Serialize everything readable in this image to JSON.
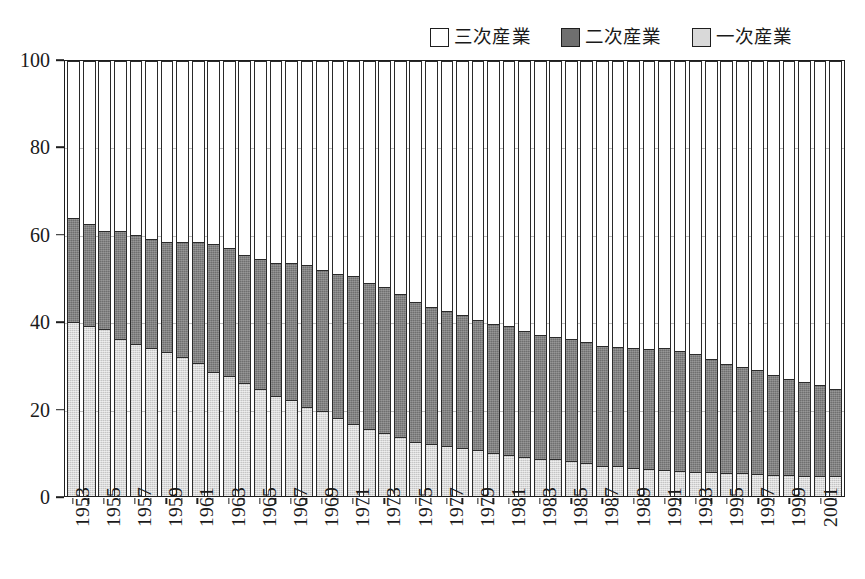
{
  "chart_data": {
    "type": "bar",
    "subtype": "stacked-100-percent-column",
    "title": "",
    "subtitle": "",
    "xlabel": "",
    "ylabel": "",
    "ylim": [
      0,
      100
    ],
    "yticks": [
      0,
      20,
      40,
      60,
      80,
      100
    ],
    "ytick_labels": [
      "0",
      "20",
      "40",
      "60",
      "80",
      "100"
    ],
    "grid": true,
    "grid_axis": "y",
    "legend_position": "top-right",
    "stack_order_bottom_to_top": [
      "primary",
      "secondary",
      "tertiary"
    ],
    "legend": [
      {
        "key": "tertiary",
        "label": "三次産業",
        "color": "#ffffff",
        "border": "#1e1e1e"
      },
      {
        "key": "secondary",
        "label": "二次産業",
        "color": "#6f6f6f",
        "border": "#1e1e1e"
      },
      {
        "key": "primary",
        "label": "一次産業",
        "color": "#d9d9d9",
        "border": "#1e1e1e"
      }
    ],
    "categories": [
      1953,
      1954,
      1955,
      1956,
      1957,
      1958,
      1959,
      1960,
      1961,
      1962,
      1963,
      1964,
      1965,
      1966,
      1967,
      1968,
      1969,
      1970,
      1971,
      1972,
      1973,
      1974,
      1975,
      1976,
      1977,
      1978,
      1979,
      1980,
      1981,
      1982,
      1983,
      1984,
      1985,
      1986,
      1987,
      1988,
      1989,
      1990,
      1991,
      1992,
      1993,
      1994,
      1995,
      1996,
      1997,
      1998,
      1999,
      2000,
      2001,
      2002
    ],
    "xtick_labels_shown": [
      "1953",
      "1955",
      "1957",
      "1959",
      "1961",
      "1963",
      "1965",
      "1967",
      "1969",
      "1971",
      "1973",
      "1975",
      "1977",
      "1979",
      "1981",
      "1983",
      "1985",
      "1987",
      "1989",
      "1991",
      "1993",
      "1995",
      "1997",
      "1999",
      "2001"
    ],
    "xtick_label_rotation_deg": 90,
    "series": [
      {
        "name": "一次産業",
        "key": "primary",
        "values": [
          40.0,
          39.0,
          38.5,
          36.0,
          35.0,
          34.0,
          33.0,
          32.0,
          30.5,
          28.5,
          27.5,
          26.0,
          24.5,
          23.0,
          22.0,
          20.5,
          19.5,
          18.0,
          16.5,
          15.5,
          14.5,
          13.5,
          12.5,
          12.0,
          11.5,
          11.0,
          10.5,
          10.0,
          9.5,
          9.0,
          8.5,
          8.5,
          8.0,
          7.5,
          7.0,
          6.8,
          6.5,
          6.2,
          6.0,
          5.8,
          5.6,
          5.5,
          5.3,
          5.2,
          5.0,
          4.9,
          4.8,
          4.7,
          4.6,
          4.5
        ]
      },
      {
        "name": "二次産業",
        "key": "secondary",
        "values": [
          24.0,
          23.5,
          22.5,
          25.0,
          25.0,
          25.0,
          25.5,
          26.5,
          28.0,
          29.5,
          29.5,
          29.5,
          30.0,
          30.5,
          31.5,
          32.5,
          32.5,
          33.0,
          34.0,
          33.5,
          33.5,
          33.0,
          32.0,
          31.5,
          31.0,
          30.5,
          30.0,
          29.5,
          29.5,
          29.0,
          28.5,
          28.0,
          28.0,
          28.0,
          27.5,
          27.5,
          27.5,
          27.5,
          28.0,
          27.5,
          27.0,
          26.0,
          25.0,
          24.5,
          24.0,
          23.0,
          22.0,
          21.5,
          21.0,
          20.0
        ]
      },
      {
        "name": "三次産業",
        "key": "tertiary",
        "values": [
          36.0,
          37.5,
          39.0,
          39.0,
          40.0,
          41.0,
          41.5,
          41.5,
          41.5,
          42.0,
          43.0,
          44.5,
          45.5,
          46.5,
          46.5,
          47.0,
          48.0,
          49.0,
          49.5,
          51.0,
          52.0,
          53.5,
          55.5,
          56.5,
          57.5,
          58.5,
          59.5,
          60.5,
          61.0,
          62.0,
          63.0,
          63.5,
          64.0,
          64.5,
          65.5,
          65.7,
          66.0,
          66.3,
          66.0,
          66.7,
          67.4,
          68.5,
          69.7,
          70.3,
          71.0,
          72.1,
          73.2,
          73.8,
          74.4,
          75.5
        ]
      }
    ],
    "stack_tops": {
      "primary_top": [
        40.0,
        39.0,
        38.5,
        36.0,
        35.0,
        34.0,
        33.0,
        32.0,
        30.5,
        28.5,
        27.5,
        26.0,
        24.5,
        23.0,
        22.0,
        20.5,
        19.5,
        18.0,
        16.5,
        15.5,
        14.5,
        13.5,
        12.5,
        12.0,
        11.5,
        11.0,
        10.5,
        10.0,
        9.5,
        9.0,
        8.5,
        8.5,
        8.0,
        7.5,
        7.0,
        6.8,
        6.5,
        6.2,
        6.0,
        5.8,
        5.6,
        5.5,
        5.3,
        5.2,
        5.0,
        4.9,
        4.8,
        4.7,
        4.6,
        4.5
      ],
      "secondary_top": [
        64.0,
        62.5,
        61.0,
        61.0,
        60.0,
        59.0,
        58.5,
        58.5,
        58.5,
        58.0,
        57.0,
        55.5,
        54.5,
        53.5,
        53.5,
        53.0,
        52.0,
        51.0,
        50.5,
        49.0,
        48.0,
        46.5,
        44.5,
        43.5,
        42.5,
        41.5,
        40.5,
        39.5,
        39.0,
        38.0,
        37.0,
        36.5,
        36.0,
        35.5,
        34.5,
        34.3,
        34.0,
        33.7,
        34.0,
        33.3,
        32.6,
        31.5,
        30.3,
        29.7,
        29.0,
        27.9,
        26.8,
        26.2,
        25.6,
        24.5
      ]
    }
  },
  "axes": {
    "y_tick_labels": [
      "100",
      "80",
      "60",
      "40",
      "20",
      "0"
    ]
  }
}
